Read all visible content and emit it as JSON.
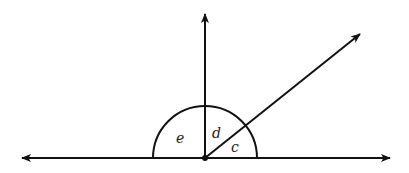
{
  "diagram": {
    "type": "angles-on-a-line",
    "labels": {
      "e": "e",
      "d": "d",
      "c": "c"
    },
    "vertex": {
      "x": 205,
      "y": 158
    },
    "arc_radius": 52,
    "rays": [
      {
        "name": "left",
        "direction_deg": 180
      },
      {
        "name": "right",
        "direction_deg": 0
      },
      {
        "name": "up",
        "direction_deg": 90
      },
      {
        "name": "diagonal",
        "direction_deg": 40
      }
    ],
    "stroke_color": "#111111",
    "background": "#ffffff"
  }
}
